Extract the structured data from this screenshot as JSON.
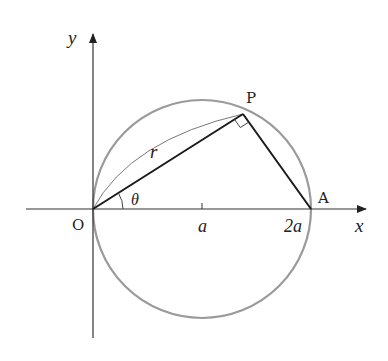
{
  "diagram": {
    "axes": {
      "x_label": "x",
      "y_label": "y",
      "origin_label": "O"
    },
    "points": {
      "P": "P",
      "A": "A"
    },
    "tick_labels": {
      "a": "a",
      "two_a": "2a"
    },
    "segment_labels": {
      "r": "r"
    },
    "angle_labels": {
      "theta": "θ"
    },
    "colors": {
      "axis": "#333333",
      "circle": "#999999",
      "segments": "#1a1a1a",
      "text": "#222222"
    }
  }
}
